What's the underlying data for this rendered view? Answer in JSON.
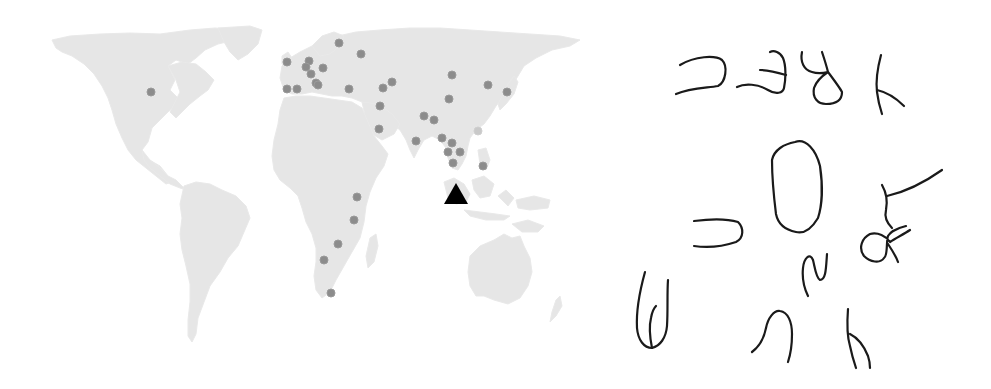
{
  "figure": {
    "panels": [
      {
        "id": "map",
        "description": "World map (light gray landmasses) with gray dots marking sample locations and a black triangle marking the target location",
        "colors": {
          "land": "#e6e6e6",
          "dot": "#8c8c8c",
          "dot_light": "#c9c9c9",
          "marker": "#000000",
          "background": "#ffffff"
        },
        "target_marker": {
          "shape": "triangle",
          "x": 456,
          "y": 196,
          "region": "Sumatra / Malay Peninsula"
        },
        "dots": [
          {
            "x": 151,
            "y": 92,
            "region": "North America"
          },
          {
            "x": 287,
            "y": 62,
            "region": "Europe"
          },
          {
            "x": 309,
            "y": 61,
            "region": "Europe"
          },
          {
            "x": 306,
            "y": 67,
            "region": "Europe"
          },
          {
            "x": 311,
            "y": 74,
            "region": "Europe"
          },
          {
            "x": 323,
            "y": 68,
            "region": "Europe"
          },
          {
            "x": 316,
            "y": 83,
            "region": "Europe"
          },
          {
            "x": 318,
            "y": 85,
            "region": "Europe"
          },
          {
            "x": 287,
            "y": 89,
            "region": "Europe"
          },
          {
            "x": 297,
            "y": 89,
            "region": "Europe"
          },
          {
            "x": 339,
            "y": 43,
            "region": "Europe"
          },
          {
            "x": 361,
            "y": 54,
            "region": "Europe"
          },
          {
            "x": 349,
            "y": 89,
            "region": "Middle East"
          },
          {
            "x": 383,
            "y": 88,
            "region": "Middle East"
          },
          {
            "x": 392,
            "y": 82,
            "region": "Middle East"
          },
          {
            "x": 380,
            "y": 106,
            "region": "Middle East"
          },
          {
            "x": 379,
            "y": 129,
            "region": "Middle East"
          },
          {
            "x": 452,
            "y": 75,
            "region": "Asia"
          },
          {
            "x": 488,
            "y": 85,
            "region": "Asia"
          },
          {
            "x": 507,
            "y": 92,
            "region": "Asia"
          },
          {
            "x": 449,
            "y": 99,
            "region": "Asia"
          },
          {
            "x": 424,
            "y": 116,
            "region": "Asia"
          },
          {
            "x": 434,
            "y": 120,
            "region": "Asia"
          },
          {
            "x": 442,
            "y": 138,
            "region": "Asia"
          },
          {
            "x": 416,
            "y": 141,
            "region": "Asia"
          },
          {
            "x": 452,
            "y": 143,
            "region": "Asia"
          },
          {
            "x": 448,
            "y": 152,
            "region": "Asia"
          },
          {
            "x": 460,
            "y": 152,
            "region": "Asia"
          },
          {
            "x": 453,
            "y": 163,
            "region": "Asia"
          },
          {
            "x": 483,
            "y": 166,
            "region": "Asia"
          },
          {
            "x": 478,
            "y": 131,
            "region": "Asia",
            "light": true
          },
          {
            "x": 357,
            "y": 197,
            "region": "Africa"
          },
          {
            "x": 354,
            "y": 220,
            "region": "Africa"
          },
          {
            "x": 338,
            "y": 244,
            "region": "Africa"
          },
          {
            "x": 324,
            "y": 260,
            "region": "Africa"
          },
          {
            "x": 331,
            "y": 293,
            "region": "Africa"
          }
        ]
      },
      {
        "id": "glyphs",
        "description": "Handwritten script glyphs drawn in black strokes",
        "stroke_color": "#1a1a1a",
        "glyph_count": 12
      }
    ]
  }
}
